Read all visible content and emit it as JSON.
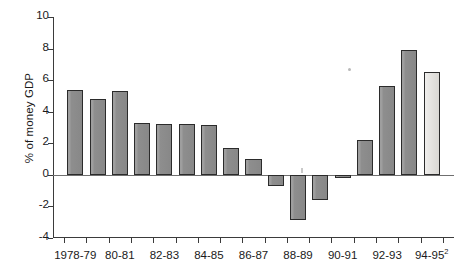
{
  "chart_data": {
    "type": "bar",
    "title": "",
    "subtitle": "",
    "xlabel": "",
    "ylabel": "% of money GDP",
    "ylim": [
      -4,
      10
    ],
    "ytick_values": [
      -4,
      -2,
      0,
      2,
      4,
      6,
      8,
      10
    ],
    "ytick_labels": [
      "-4",
      "-2",
      "0",
      "2",
      "4",
      "6",
      "8",
      "10"
    ],
    "grid": false,
    "legend": "none",
    "categories": [
      "1978-79",
      "79-80",
      "80-81",
      "81-82",
      "82-83",
      "83-84",
      "84-85",
      "85-86",
      "86-87",
      "87-88",
      "88-89",
      "89-90",
      "90-91",
      "91-92",
      "92-93",
      "93-94",
      "94-95"
    ],
    "xtick_labels": [
      "1978-79",
      "80-81",
      "82-83",
      "84-85",
      "86-87",
      "88-89",
      "90-91",
      "92-93",
      "94-95"
    ],
    "xtick_label_last_superscript": "2",
    "values": [
      5.35,
      4.8,
      5.3,
      3.3,
      3.2,
      3.2,
      3.15,
      1.7,
      1.0,
      -0.7,
      -2.85,
      -1.6,
      -0.2,
      2.2,
      5.6,
      7.9,
      6.5
    ],
    "bar_styles": [
      "solid",
      "solid",
      "solid",
      "solid",
      "solid",
      "solid",
      "solid",
      "solid",
      "solid",
      "solid",
      "solid",
      "solid",
      "solid",
      "solid",
      "solid",
      "solid",
      "light"
    ],
    "colors": {
      "bar_fill": "#8c8c8c",
      "bar_fill_estimate": "#dedcd8",
      "bar_border": "#2b2b2b",
      "axis": "#3b3b3b",
      "zero_line": "#6f6f6f",
      "text": "#1a1a1a"
    }
  }
}
